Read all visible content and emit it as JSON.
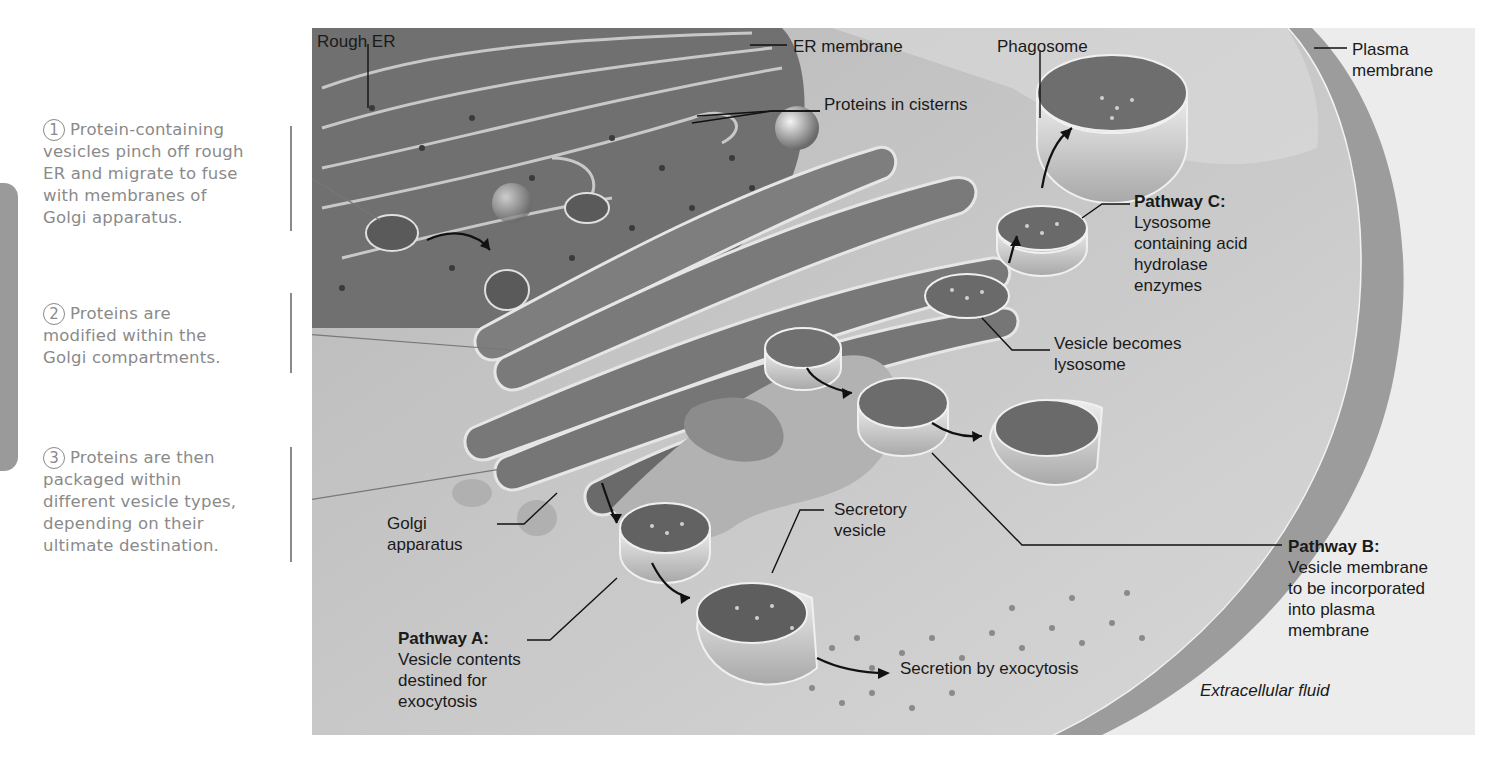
{
  "steps": [
    {
      "number": "1",
      "lines": [
        "Protein-containing",
        "vesicles pinch off rough",
        "ER and migrate to fuse",
        "with membranes of",
        "Golgi apparatus."
      ]
    },
    {
      "number": "2",
      "lines": [
        "Proteins are",
        "modified within the",
        "Golgi compartments."
      ]
    },
    {
      "number": "3",
      "lines": [
        "Proteins are then",
        "packaged within",
        "different vesicle types,",
        "depending on their",
        "ultimate destination."
      ]
    }
  ],
  "labels": {
    "rough_er": "Rough ER",
    "er_membrane": "ER membrane",
    "proteins_in_cisterns": "Proteins in cisterns",
    "phagosome": "Phagosome",
    "plasma_membrane": [
      "Plasma",
      "membrane"
    ],
    "pathway_c": {
      "title": "Pathway C:",
      "lines": [
        "Lysosome",
        "containing acid",
        "hydrolase",
        "enzymes"
      ]
    },
    "vesicle_becomes_lysosome": [
      "Vesicle becomes",
      "lysosome"
    ],
    "golgi_apparatus": [
      "Golgi",
      "apparatus"
    ],
    "secretory_vesicle": [
      "Secretory",
      "vesicle"
    ],
    "pathway_a": {
      "title": "Pathway A:",
      "lines": [
        "Vesicle contents",
        "destined for",
        "exocytosis"
      ]
    },
    "pathway_b": {
      "title": "Pathway B:",
      "lines": [
        "Vesicle membrane",
        "to be incorporated",
        "into plasma",
        "membrane"
      ]
    },
    "secretion_by_exocytosis": "Secretion by exocytosis",
    "extracellular_fluid": "Extracellular fluid"
  },
  "colors": {
    "panel_bg": "#e3e3e3",
    "cytoplasm": "#c8c8c8",
    "er_dark": "#6e6e6e",
    "golgi": "#7a7a7a",
    "membrane_light": "#e8e8e8",
    "caption_gray": "#8a8a8a",
    "label_text": "#1a1a1a"
  }
}
